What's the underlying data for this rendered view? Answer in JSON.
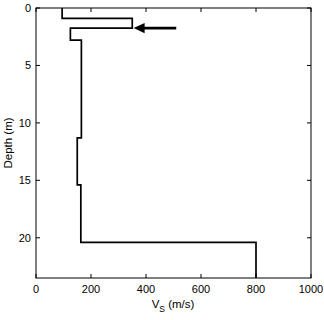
{
  "figure": {
    "background_color": "#ffffff",
    "line_color": "#000000",
    "axis_color": "#000000"
  },
  "chart_data": {
    "type": "line",
    "title": "",
    "xlabel": "V_S (m/s)",
    "xlabel_main": "V",
    "xlabel_sub": "S",
    "xlabel_unit": " (m/s)",
    "ylabel": "Depth (m)",
    "xlim": [
      0,
      1000
    ],
    "ylim": [
      0,
      23.5
    ],
    "y_inverted": true,
    "grid": false,
    "legend": null,
    "xticks": [
      0,
      200,
      400,
      600,
      800,
      1000
    ],
    "xticklabels": [
      "0",
      "200",
      "400",
      "600",
      "800",
      "1000"
    ],
    "yticks": [
      0,
      5,
      10,
      15,
      20
    ],
    "yticklabels": [
      "0",
      "5",
      "10",
      "15",
      "20"
    ],
    "series": [
      {
        "name": "Vs profile",
        "style": "step-post",
        "layers": [
          {
            "depth_top": 0.0,
            "depth_bottom": 0.9,
            "vs": 95
          },
          {
            "depth_top": 0.9,
            "depth_bottom": 1.75,
            "vs": 350
          },
          {
            "depth_top": 1.75,
            "depth_bottom": 2.8,
            "vs": 125
          },
          {
            "depth_top": 2.8,
            "depth_bottom": 11.3,
            "vs": 165
          },
          {
            "depth_top": 11.3,
            "depth_bottom": 15.4,
            "vs": 150
          },
          {
            "depth_top": 15.4,
            "depth_bottom": 20.4,
            "vs": 163
          },
          {
            "depth_top": 20.4,
            "depth_bottom": 23.5,
            "vs": 800
          }
        ]
      }
    ],
    "annotations": [
      {
        "type": "arrow",
        "name": "low-velocity-layer-arrow",
        "direction": "left",
        "tail_x": 510,
        "head_x": 355,
        "y_depth": 1.75
      }
    ]
  }
}
